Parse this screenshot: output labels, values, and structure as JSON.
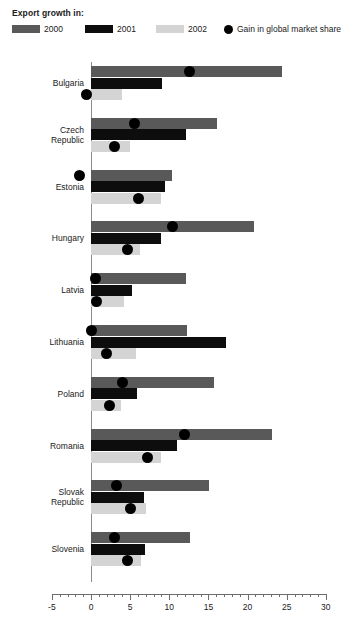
{
  "legend": {
    "title": "Export growth in:",
    "items": [
      {
        "label": "2000",
        "color": "#595959",
        "marker": "swatch",
        "name": "legend-2000"
      },
      {
        "label": "2001",
        "color": "#0d0d0d",
        "marker": "swatch",
        "name": "legend-2001"
      },
      {
        "label": "2002",
        "color": "#d4d4d4",
        "marker": "swatch",
        "name": "legend-2002"
      },
      {
        "label": "Gain in global market share",
        "color": "#000000",
        "marker": "dot",
        "name": "legend-gain"
      }
    ]
  },
  "chart_data": {
    "type": "bar",
    "orientation": "horizontal",
    "title": "",
    "subtitle": "",
    "xlabel": "",
    "ylabel": "",
    "xlim": [
      -5,
      30
    ],
    "xticks": [
      -5,
      0,
      5,
      10,
      15,
      20,
      25,
      30
    ],
    "xtick_labels": [
      "-5",
      "0",
      "5",
      "10",
      "15",
      "20",
      "25",
      "30"
    ],
    "minor_tick_step": 1,
    "grid": false,
    "legend_position": "top",
    "categories": [
      "Bulgaria",
      "Czech\nRepublic",
      "Estonia",
      "Hungary",
      "Latvia",
      "Lithuania",
      "Poland",
      "Romania",
      "Slovak\nRepublic",
      "Slovenia"
    ],
    "series": [
      {
        "name": "2000",
        "color": "#595959",
        "values": [
          24.4,
          16.1,
          10.4,
          20.8,
          12.1,
          12.3,
          15.7,
          23.1,
          15.1,
          12.6
        ]
      },
      {
        "name": "2001",
        "color": "#0d0d0d",
        "values": [
          9.1,
          12.1,
          9.4,
          9.0,
          5.3,
          17.2,
          5.9,
          11.0,
          6.8,
          6.9
        ]
      },
      {
        "name": "2002",
        "color": "#d4d4d4",
        "values": [
          4.0,
          5.0,
          9.0,
          6.3,
          4.2,
          5.7,
          3.8,
          9.0,
          7.0,
          6.4
        ]
      }
    ],
    "markers": {
      "name": "Gain in global market share",
      "color": "#000000",
      "points": [
        {
          "category": "Bulgaria",
          "upper": 12.6,
          "lower": -0.6
        },
        {
          "category": "Czech Republic",
          "upper": 5.5,
          "lower": 3.0
        },
        {
          "category": "Estonia",
          "upper": -1.5,
          "lower": 6.1
        },
        {
          "category": "Hungary",
          "upper": 10.4,
          "lower": 4.6
        },
        {
          "category": "Latvia",
          "upper": 0.6,
          "lower": 0.7
        },
        {
          "category": "Lithuania",
          "upper": 0.0,
          "lower": 2.0
        },
        {
          "category": "Poland",
          "upper": 4.0,
          "lower": 2.3
        },
        {
          "category": "Romania",
          "upper": 12.0,
          "lower": 7.2
        },
        {
          "category": "Slovak Republic",
          "upper": 3.3,
          "lower": 5.0
        },
        {
          "category": "Slovenia",
          "upper": 3.0,
          "lower": 4.7
        }
      ]
    }
  }
}
